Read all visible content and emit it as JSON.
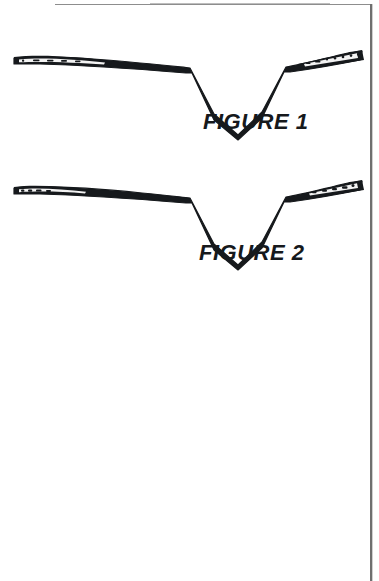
{
  "page": {
    "background_color": "#ffffff",
    "ink_color": "#16191c",
    "border_color": "#6f6f6f",
    "width": 379,
    "height": 581
  },
  "drawing": {
    "type": "patent-line-drawing",
    "description": "Two elongated wishbone shaped components each having tapered wing arms and a central V notch",
    "figures": [
      {
        "id": "figure-1",
        "label": "FIGURE 1",
        "label_position": {
          "x": 203,
          "y": 109
        },
        "notch_apex": {
          "x": 186,
          "y": 135
        },
        "left_tip": {
          "x": 14,
          "y": 58
        },
        "right_tip": {
          "x": 362,
          "y": 52
        },
        "arm_marks_left": 5,
        "arm_marks_right": 7
      },
      {
        "id": "figure-2",
        "label": "FIGURE 2",
        "label_position": {
          "x": 199,
          "y": 240
        },
        "notch_apex": {
          "x": 186,
          "y": 265
        },
        "left_tip": {
          "x": 14,
          "y": 188
        },
        "right_tip": {
          "x": 362,
          "y": 183
        },
        "arm_marks_left": 4,
        "arm_marks_right": 5
      }
    ]
  }
}
